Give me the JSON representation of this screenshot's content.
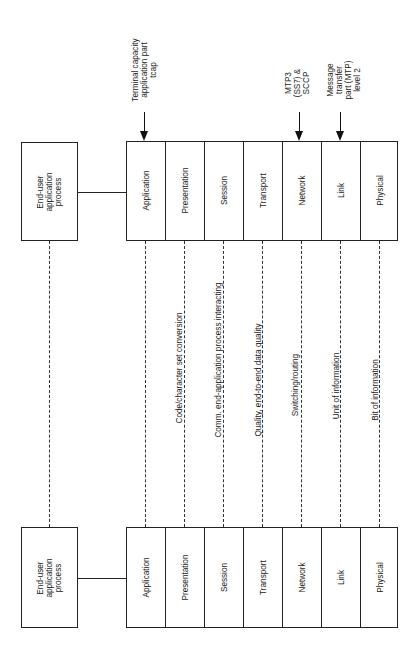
{
  "diagram": {
    "type": "OSI layered model with SS7 mapping",
    "orientation": "rotated 90deg counter-clockwise",
    "end_user_box": {
      "label_lines": [
        "End-user",
        "application",
        "process"
      ]
    },
    "layers": [
      {
        "name": "Application",
        "service": ""
      },
      {
        "name": "Presentation",
        "service": "Code/character set conversion"
      },
      {
        "name": "Session",
        "service": "Comm. end-application process interacting"
      },
      {
        "name": "Transport",
        "service": "Quality, end-to-end data quality"
      },
      {
        "name": "Network",
        "service": "Switching/routing"
      },
      {
        "name": "Link",
        "service": "Unit of information"
      },
      {
        "name": "Physical",
        "service": "Bit of information"
      }
    ],
    "annotations": [
      {
        "target_layer": "Application",
        "lines": [
          "Terminal capacity",
          "application part",
          "tcap"
        ]
      },
      {
        "target_layer": "Network",
        "lines": [
          "MTP3",
          "(SS7) &",
          "SCCP"
        ]
      },
      {
        "target_layer": "Link",
        "lines": [
          "Message",
          "transfer",
          "part (MTP)",
          "level 2"
        ]
      }
    ],
    "colors": {
      "line": "#222222",
      "background": "#ffffff",
      "text": "#1a1a1a"
    }
  }
}
